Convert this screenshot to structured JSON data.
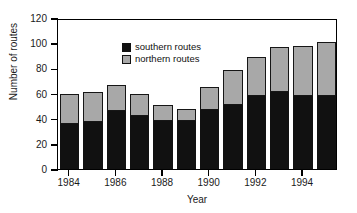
{
  "chart_data": {
    "type": "bar",
    "subtype": "stacked-vertical",
    "title": "",
    "xlabel": "Year",
    "ylabel": "Number of routes",
    "categories": [
      "1984",
      "1985",
      "1986",
      "1987",
      "1988",
      "1989",
      "1990",
      "1991",
      "1992",
      "1993",
      "1994",
      "1995"
    ],
    "series": [
      {
        "name": "southern routes",
        "color": "#111111",
        "values": [
          36,
          37,
          46,
          42,
          38,
          38,
          47,
          51,
          58,
          61,
          58,
          58
        ]
      },
      {
        "name": "northern routes",
        "color": "#a8a8a8",
        "values": [
          24,
          24,
          21,
          18,
          13,
          10,
          18,
          28,
          31,
          36,
          40,
          43
        ]
      }
    ],
    "totals": [
      60,
      61,
      67,
      60,
      51,
      48,
      65,
      79,
      89,
      97,
      98,
      101
    ],
    "ylim": [
      0,
      120
    ],
    "yticks": [
      0,
      20,
      40,
      60,
      80,
      100,
      120
    ],
    "ytick_labels": [
      "0",
      "20",
      "40",
      "60",
      "80",
      "100",
      "120"
    ],
    "xticks": [
      "1984",
      "1986",
      "1988",
      "1990",
      "1992",
      "1994"
    ],
    "xtick_labels": [
      "1984",
      "1986",
      "1988",
      "1990",
      "1992",
      "1994"
    ],
    "grid": false,
    "legend_position": "top-left",
    "legend": [
      {
        "label": "southern routes",
        "swatch": "#111111"
      },
      {
        "label": "northern routes",
        "swatch": "#a8a8a8"
      }
    ]
  }
}
